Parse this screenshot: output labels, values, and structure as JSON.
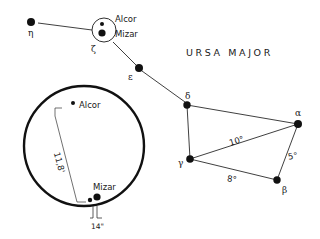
{
  "diagram": {
    "title": "URSA MAJOR",
    "colors": {
      "ink": "#1a1a1a",
      "background": "#ffffff"
    },
    "stars": [
      {
        "id": "eta",
        "label": "η",
        "x": 31,
        "y": 22,
        "r": 4,
        "label_x": 28,
        "label_y": 36
      },
      {
        "id": "zeta",
        "label": "ζ",
        "x": 104,
        "y": 30,
        "r": 0,
        "label_x": 91,
        "label_y": 52
      },
      {
        "id": "epsilon",
        "label": "ε",
        "x": 139,
        "y": 68,
        "r": 4,
        "label_x": 128,
        "label_y": 80
      },
      {
        "id": "delta",
        "label": "δ",
        "x": 187,
        "y": 105,
        "r": 4,
        "label_x": 185,
        "label_y": 99
      },
      {
        "id": "alpha",
        "label": "α",
        "x": 298,
        "y": 124,
        "r": 4,
        "label_x": 295,
        "label_y": 116
      },
      {
        "id": "gamma",
        "label": "γ",
        "x": 190,
        "y": 159,
        "r": 4,
        "label_x": 178,
        "label_y": 166
      },
      {
        "id": "beta",
        "label": "β",
        "x": 277,
        "y": 180,
        "r": 4,
        "label_x": 282,
        "label_y": 193
      }
    ],
    "zeta_group": {
      "circle": {
        "cx": 104,
        "cy": 30,
        "r": 12
      },
      "alcor": {
        "label": "Alcor",
        "x": 102,
        "y": 24,
        "r": 2
      },
      "mizar": {
        "label": "Mizar",
        "x": 102,
        "y": 34,
        "r": 3.5
      }
    },
    "angular_distances": [
      {
        "from": "gamma",
        "to": "alpha",
        "label": "10°"
      },
      {
        "from": "gamma",
        "to": "beta",
        "label": "8°"
      },
      {
        "from": "alpha",
        "to": "beta",
        "label": "5°"
      }
    ],
    "inset": {
      "circle": {
        "cx": 84,
        "cy": 146,
        "r": 60
      },
      "alcor": {
        "label": "Alcor"
      },
      "mizar": {
        "label": "Mizar"
      },
      "alcor_mizar_separation": "11,8'",
      "mizar_pair_separation": "14\""
    }
  }
}
